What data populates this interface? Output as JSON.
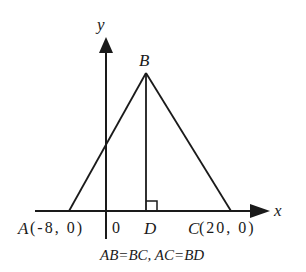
{
  "diagram": {
    "axes": {
      "x_label": "x",
      "y_label": "y",
      "origin_label": "0"
    },
    "points": {
      "A": {
        "name": "A",
        "coords": "(-8, 0)"
      },
      "B": {
        "name": "B"
      },
      "C": {
        "name": "C",
        "coords": "(20, 0)"
      },
      "D": {
        "name": "D"
      }
    },
    "caption": "AB=BC, AC=BD",
    "colors": {
      "stroke": "#1a1a1a",
      "background": "#ffffff"
    }
  }
}
